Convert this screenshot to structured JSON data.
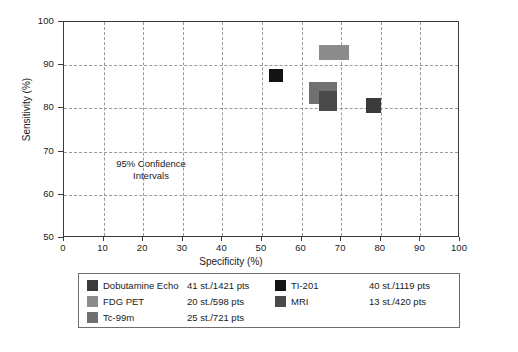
{
  "chart_data": {
    "type": "scatter",
    "title": "",
    "xlabel": "Specificity (%)",
    "ylabel": "Sensitivity (%)",
    "xlim": [
      0,
      100
    ],
    "ylim": [
      50,
      100
    ],
    "xticks": [
      0,
      10,
      20,
      30,
      40,
      50,
      60,
      70,
      80,
      90,
      100
    ],
    "yticks": [
      50,
      60,
      70,
      80,
      90,
      100
    ],
    "grid": true,
    "grid_style": "dashed",
    "legend_position": "below-plot",
    "annotation": {
      "line1": "95% Confidence",
      "line2": "Intervals",
      "x": 28,
      "y": 68
    },
    "note": "Each marker is a 95% confidence interval rectangle; width spans the specificity CI and height spans the sensitivity CI.",
    "series": [
      {
        "name": "Dobutamine Echo",
        "stats": "41 st./1421 pts",
        "studies": 41,
        "patients": 1421,
        "color": "#3a3a3a",
        "specificity": 78.0,
        "sensitivity": 80.5,
        "spec_ci": [
          76.3,
          80.0
        ],
        "sens_ci": [
          79.0,
          82.5
        ]
      },
      {
        "name": "FDG PET",
        "stats": "20 st./598 pts",
        "studies": 20,
        "patients": 598,
        "color": "#8c8c8c",
        "specificity": 68.2,
        "sensitivity": 92.9,
        "spec_ci": [
          64.4,
          72.0
        ],
        "sens_ci": [
          91.2,
          94.7
        ]
      },
      {
        "name": "Tc-99m",
        "stats": "25 st./721 pts",
        "studies": 25,
        "patients": 721,
        "color": "#707070",
        "specificity": 65.5,
        "sensitivity": 83.5,
        "spec_ci": [
          61.9,
          69.0
        ],
        "sens_ci": [
          81.0,
          86.1
        ]
      },
      {
        "name": "TI-201",
        "stats": "40 st./1119 pts",
        "studies": 40,
        "patients": 1119,
        "color": "#141414",
        "specificity": 53.5,
        "sensitivity": 87.7,
        "spec_ci": [
          51.8,
          55.3
        ],
        "sens_ci": [
          86.2,
          89.1
        ]
      },
      {
        "name": "MRI",
        "stats": "13 st./420 pts",
        "studies": 13,
        "patients": 420,
        "color": "#4a4a4a",
        "specificity": 66.8,
        "sensitivity": 81.8,
        "spec_ci": [
          64.4,
          69.0
        ],
        "sens_ci": [
          79.5,
          84.0
        ]
      }
    ]
  },
  "axis": {
    "x_tick_labels": [
      "0",
      "10",
      "20",
      "30",
      "40",
      "50",
      "60",
      "70",
      "80",
      "90",
      "100"
    ],
    "y_tick_labels": [
      "50",
      "60",
      "70",
      "80",
      "90",
      "100"
    ],
    "x_title": "Specificity (%)",
    "y_title": "Sensitivity (%)"
  },
  "legend": {
    "entries": [
      {
        "label": "Dobutamine Echo",
        "stats": "41 st./1421 pts",
        "color": "#3a3a3a",
        "column": 0,
        "row": 0
      },
      {
        "label": "FDG PET",
        "stats": "20 st./598 pts",
        "color": "#8c8c8c",
        "column": 0,
        "row": 1
      },
      {
        "label": "Tc-99m",
        "stats": "25 st./721 pts",
        "color": "#707070",
        "column": 0,
        "row": 2
      },
      {
        "label": "TI-201",
        "stats": "40 st./1119 pts",
        "color": "#141414",
        "column": 1,
        "row": 0
      },
      {
        "label": "MRI",
        "stats": "13 st./420 pts",
        "color": "#4a4a4a",
        "column": 1,
        "row": 1
      }
    ]
  },
  "colors": {
    "background": "#ffffff",
    "axis": "#3a3a3a",
    "grid": "#9a9a9a",
    "text": "#1a1a1a",
    "legend_border": "#6e6e6e"
  }
}
